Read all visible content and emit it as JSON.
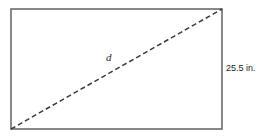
{
  "figure": {
    "type": "geometry-diagram",
    "background_color": "#ffffff",
    "rectangle": {
      "name": "screen-rectangle",
      "stroke_color": "#6b6b6b",
      "stroke_width": 1.6,
      "fill": "none",
      "x": 11,
      "y": 9,
      "width": 211,
      "height": 120
    },
    "diagonal": {
      "name": "diagonal-dashed-line",
      "stroke_color": "#3a3a46",
      "stroke_width": 1.5,
      "dash_pattern": "5 3",
      "x1": 11,
      "y1": 129,
      "x2": 222,
      "y2": 9
    },
    "labels": {
      "diagonal": "d",
      "right_side": "25.5 in."
    }
  }
}
